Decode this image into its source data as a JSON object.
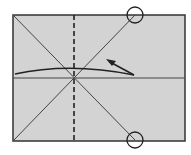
{
  "diagram": {
    "type": "origami-fold-diagram",
    "background": "#ffffff",
    "paper": {
      "fill": "#d3d3d3",
      "stroke": "#333333",
      "x": 13,
      "y": 15,
      "width": 172,
      "height": 126
    },
    "lines": {
      "diagonal_1": {
        "x1": 13,
        "y1": 15,
        "x2": 135,
        "y2": 140
      },
      "diagonal_2": {
        "x1": 13,
        "y1": 141,
        "x2": 135,
        "y2": 15
      },
      "horizontal_crease": {
        "x1": 13,
        "y1": 78,
        "x2": 185,
        "y2": 78
      },
      "valley_fold_dashed": {
        "x1": 74,
        "y1": 15,
        "x2": 74,
        "y2": 141
      }
    },
    "markers": [
      {
        "name": "top-circle",
        "cx": 135,
        "cy": 15,
        "r": 8
      },
      {
        "name": "bottom-circle",
        "cx": 135,
        "cy": 140,
        "r": 8
      }
    ],
    "fold_arrow": {
      "path": "M15,74 Q70,62 134,75",
      "stroke": "#222222",
      "head": {
        "tip_x": 107,
        "tip_y": 60,
        "from_x": 134,
        "from_y": 75
      }
    },
    "colors": {
      "paper": "#d3d3d3",
      "lines": "#444444",
      "dashed": "#222222",
      "outline": "#333333"
    }
  }
}
